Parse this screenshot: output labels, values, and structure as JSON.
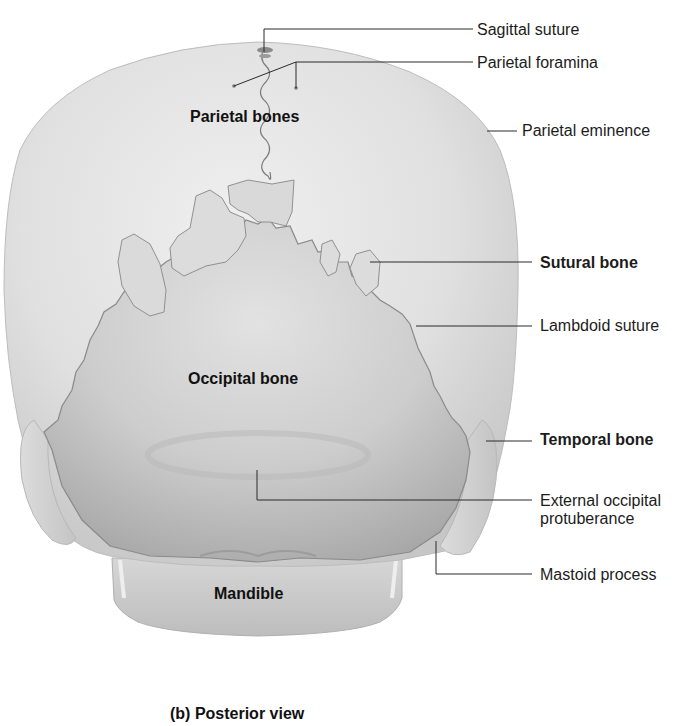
{
  "figure": {
    "caption": "(b) Posterior view",
    "view": "posterior"
  },
  "inner_labels": {
    "parietal_bones": "Parietal bones",
    "occipital_bone": "Occipital bone",
    "mandible": "Mandible"
  },
  "callouts": [
    {
      "id": "sagittal-suture",
      "text": "Sagittal suture",
      "bold": false
    },
    {
      "id": "parietal-foramina",
      "text": "Parietal foramina",
      "bold": false
    },
    {
      "id": "parietal-eminence",
      "text": "Parietal eminence",
      "bold": false
    },
    {
      "id": "sutural-bone",
      "text": "Sutural bone",
      "bold": true
    },
    {
      "id": "lambdoid-suture",
      "text": "Lambdoid suture",
      "bold": false
    },
    {
      "id": "temporal-bone",
      "text": "Temporal bone",
      "bold": true
    },
    {
      "id": "external-occipital-protuberance",
      "text": "External occipital",
      "text2": "protuberance",
      "bold": false
    },
    {
      "id": "mastoid-process",
      "text": "Mastoid process",
      "bold": false
    }
  ],
  "colors": {
    "background": "#ffffff",
    "bone_light": "#e6e6e6",
    "bone_mid": "#cfcfcf",
    "bone_dark": "#a9a9a9",
    "suture_line": "#7a7a7a",
    "leader_line": "#2a2a2a"
  }
}
